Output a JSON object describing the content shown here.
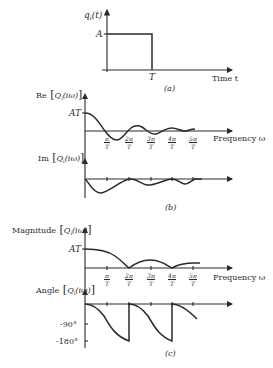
{
  "panel_a": {
    "y_label": "q",
    "y_label_sub": "i",
    "y_label_arg": "(t)",
    "level_label": "A",
    "t_label": "T",
    "x_label": "Time t",
    "caption": "(a)"
  },
  "panel_b": {
    "re_label_pre": "Re",
    "re_label_q": "Q",
    "re_label_sub": "i",
    "re_label_arg": "(iω)",
    "at_label": "AT",
    "im_label_pre": "Im",
    "im_label_q": "Q",
    "im_label_sub": "i",
    "im_label_arg": "(iω)",
    "x_label": "Frequency ω",
    "ticks": [
      {
        "num": "π",
        "den": "T"
      },
      {
        "num": "2π",
        "den": "T"
      },
      {
        "num": "3π",
        "den": "T"
      },
      {
        "num": "4π",
        "den": "T"
      },
      {
        "num": "5π",
        "den": "T"
      }
    ],
    "caption": "(b)"
  },
  "panel_c": {
    "mag_label_pre": "Magnitude",
    "mag_label_q": "Q",
    "mag_label_sub": "i",
    "mag_label_arg": "(iω)",
    "at_label": "AT",
    "angle_label_pre": "Angle",
    "angle_label_q": "Q",
    "angle_label_sub": "i",
    "angle_label_arg": "(iω)",
    "x_label": "Frequency ω",
    "ticks": [
      {
        "num": "π",
        "den": "T"
      },
      {
        "num": "2π",
        "den": "T"
      },
      {
        "num": "3π",
        "den": "T"
      },
      {
        "num": "4π",
        "den": "T"
      },
      {
        "num": "5π",
        "den": "T"
      }
    ],
    "angle_ticks": [
      "-90°",
      "-180°"
    ],
    "caption": "(c)"
  }
}
